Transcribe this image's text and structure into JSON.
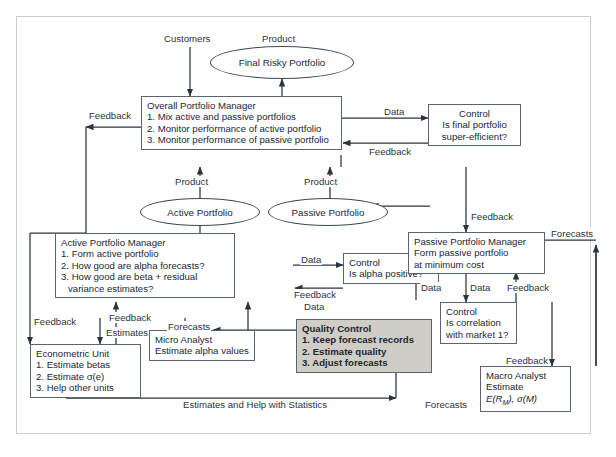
{
  "diagram": {
    "colors": {
      "box_border": "#5a6472",
      "frame_border": "#c9cdd4",
      "quality_control_fill": "#cfcdc6",
      "text": "#1c2733",
      "arrow": "#2b3440"
    },
    "nodes": [
      {
        "id": "overall-portfolio-manager",
        "shape": "box",
        "lines": [
          "Overall Portfolio Manager",
          "1. Mix active and passive portfolios",
          "2. Monitor performance of active portfolio",
          "3. Monitor performance of passive portfolio"
        ]
      },
      {
        "id": "control-final-portfolio",
        "shape": "box",
        "lines": [
          "Control",
          "Is final portfolio",
          "super-efficient?"
        ]
      },
      {
        "id": "active-portfolio-manager",
        "shape": "box",
        "lines": [
          "Active Portfolio Manager",
          "1. Form active portfolio",
          "2. How good are alpha forecasts?",
          "3. How good are beta + residual",
          "    variance estimates?"
        ]
      },
      {
        "id": "control-alpha-positive",
        "shape": "box",
        "lines": [
          "Control",
          "Is alpha positive?"
        ]
      },
      {
        "id": "passive-portfolio-manager",
        "shape": "box",
        "lines": [
          "Passive Portfolio Manager",
          "Form passive portfolio",
          "at minimum  cost"
        ]
      },
      {
        "id": "control-correlation-market",
        "shape": "box",
        "lines": [
          "Control",
          "Is correlation",
          "with market 1?"
        ]
      },
      {
        "id": "quality-control",
        "shape": "box",
        "style": "filled",
        "lines": [
          "Quality Control",
          "1. Keep forecast records",
          "2. Estimate quality",
          "3. Adjust forecasts"
        ]
      },
      {
        "id": "econometric-unit",
        "shape": "box",
        "lines": [
          "Econometric Unit",
          "1. Estimate betas",
          "2. Estimate σ(e)",
          "3. Help other units"
        ]
      },
      {
        "id": "micro-analyst",
        "shape": "box",
        "lines": [
          "Micro Analyst",
          "Estimate alpha values"
        ]
      },
      {
        "id": "macro-analyst",
        "shape": "box",
        "lines": [
          "Macro Analyst",
          "Estimate",
          "E(R_M), σ(M)"
        ]
      },
      {
        "id": "final-risky-portfolio",
        "shape": "ellipse",
        "lines": [
          "Final Risky Portfolio"
        ]
      },
      {
        "id": "active-portfolio",
        "shape": "ellipse",
        "lines": [
          "Active Portfolio"
        ]
      },
      {
        "id": "passive-portfolio",
        "shape": "ellipse",
        "lines": [
          "Passive Portfolio"
        ]
      }
    ],
    "node_text": {
      "opm_title": "Overall Portfolio Manager",
      "opm_l1": "1. Mix active and passive portfolios",
      "opm_l2": "2. Monitor performance of active portfolio",
      "opm_l3": "3. Monitor performance of passive portfolio",
      "ctrl_final_l1": "Control",
      "ctrl_final_l2": "Is final portfolio",
      "ctrl_final_l3": "super-efficient?",
      "apm_title": "Active Portfolio Manager",
      "apm_l1": "1. Form active portfolio",
      "apm_l2": "2. How good are alpha forecasts?",
      "apm_l3": "3. How good are beta + residual",
      "apm_l4": "variance estimates?",
      "ctrl_alpha_l1": "Control",
      "ctrl_alpha_l2": "Is alpha positive?",
      "ppm_title": "Passive Portfolio Manager",
      "ppm_l1": "Form passive portfolio",
      "ppm_l2": "at minimum  cost",
      "ctrl_corr_l1": "Control",
      "ctrl_corr_l2": "Is correlation",
      "ctrl_corr_l3": "with market 1?",
      "qc_title": "Quality Control",
      "qc_l1": "1. Keep forecast records",
      "qc_l2": "2. Estimate quality",
      "qc_l3": "3. Adjust forecasts",
      "econ_title": "Econometric Unit",
      "econ_l1": "1. Estimate betas",
      "econ_l2": "2. Estimate σ(e)",
      "econ_l3": "3. Help other units",
      "micro_title": "Micro Analyst",
      "micro_l1": "Estimate alpha values",
      "macro_title": "Macro Analyst",
      "macro_l1": "Estimate",
      "macro_l2a": "E(R",
      "macro_l2b": "M",
      "macro_l2c": "), σ(M)",
      "ell_final": "Final Risky Portfolio",
      "ell_active": "Active Portfolio",
      "ell_passive": "Passive Portfolio"
    },
    "edge_labels": {
      "customers": "Customers",
      "product_top": "Product",
      "feedback_left_top": "Feedback",
      "data_opm_ctrl": "Data",
      "feedback_ctrl_opm": "Feedback",
      "product_active": "Product",
      "product_passive": "Product",
      "feedback_right_ppm": "Feedback",
      "data_apm_ctrl": "Data",
      "feedback_data_1": "Feedback",
      "feedback_data_2": "Data",
      "forecasts_right_top": "Forecasts",
      "data_left_ppm": "Data",
      "data_ppm_ctrl": "Data",
      "feedback_ctrl_ppm": "Feedback",
      "feedback_left_econ": "Feedback",
      "feedback_mid_econ": "Feedback",
      "estimates_mid": "Estimates",
      "forecasts_micro": "Forecasts",
      "feedback_macro": "Feedback",
      "estimates_help": "Estimates and Help with Statistics",
      "forecasts_bottom": "Forecasts"
    }
  }
}
